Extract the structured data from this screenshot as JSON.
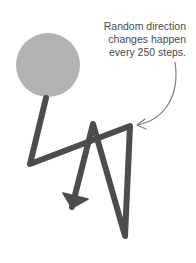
{
  "annotation": {
    "lines": [
      "Random direction",
      "changes happen",
      "every 250 steps."
    ]
  },
  "diagram": {
    "ball": {
      "cx": 48,
      "cy": 65,
      "r": 32,
      "color": "#b3b3b3"
    },
    "path": {
      "points": "46,98 30,164 130,126 125,236 93,124 72,207",
      "color": "#4d4d4d",
      "stroke_width": 6
    },
    "arrowhead": {
      "points": "63,193 88,199 72,208",
      "color": "#4d4d4d"
    },
    "pointer": {
      "path": "M175,62 C180,95 165,120 137,125",
      "head": "M145,119 L137,125 L146,129",
      "color": "#808080"
    }
  }
}
